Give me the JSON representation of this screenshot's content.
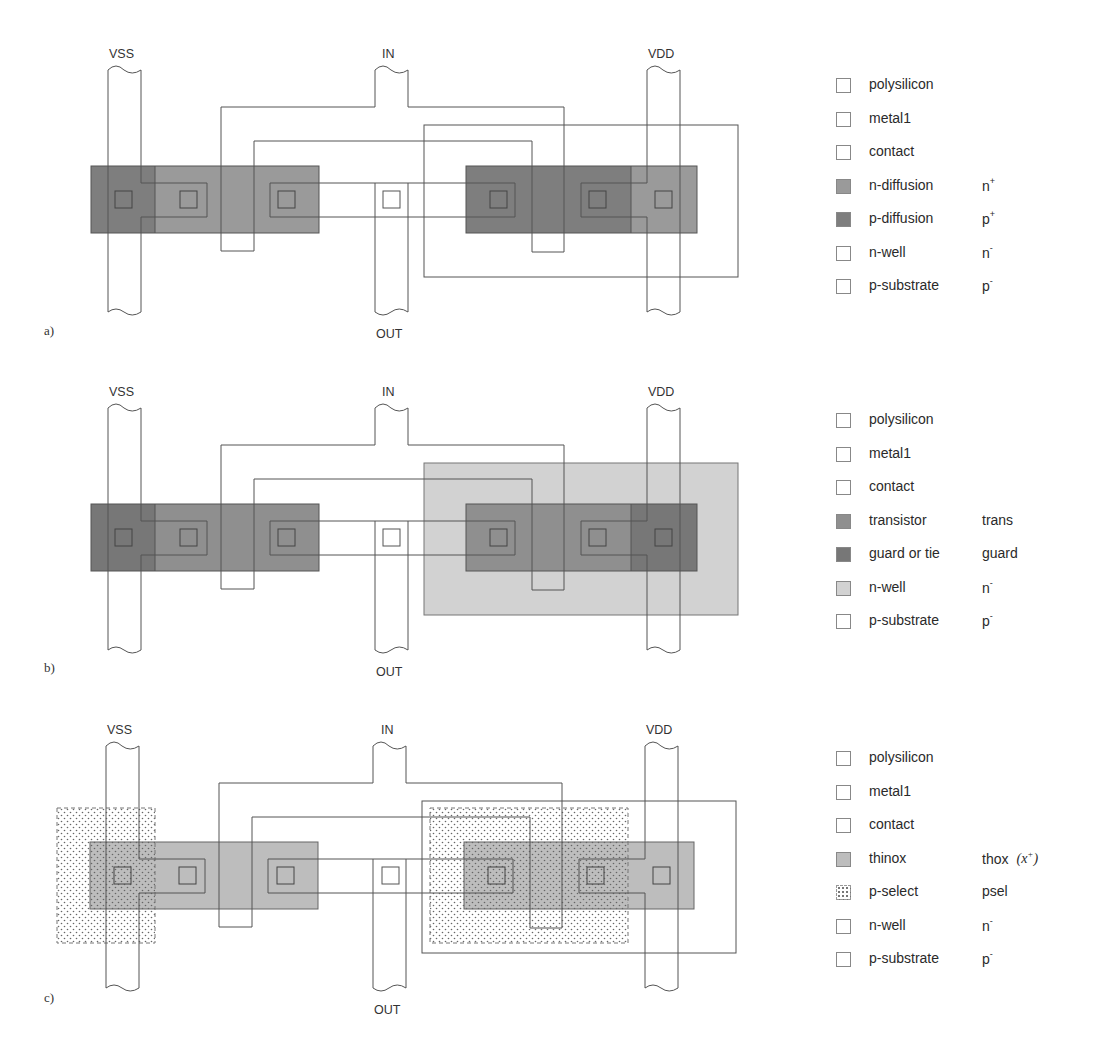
{
  "figure": {
    "panels": [
      {
        "id": "a",
        "label": "a)",
        "signals": {
          "vss": "VSS",
          "in": "IN",
          "out": "OUT",
          "vdd": "VDD"
        },
        "legend": [
          {
            "name": "polysilicon",
            "abbr": "",
            "sup": "",
            "swatch": "#ffffff",
            "pattern": "none"
          },
          {
            "name": "metal1",
            "abbr": "",
            "sup": "",
            "swatch": "#ffffff",
            "pattern": "none"
          },
          {
            "name": "contact",
            "abbr": "",
            "sup": "",
            "swatch": "#ffffff",
            "pattern": "none"
          },
          {
            "name": "n-diffusion",
            "abbr": "n",
            "sup": "+",
            "swatch": "#9a9a9a",
            "pattern": "none"
          },
          {
            "name": "p-diffusion",
            "abbr": "p",
            "sup": "+",
            "swatch": "#7e7e7e",
            "pattern": "none"
          },
          {
            "name": "n-well",
            "abbr": "n",
            "sup": "-",
            "swatch": "#ffffff",
            "pattern": "none"
          },
          {
            "name": "p-substrate",
            "abbr": "p",
            "sup": "-",
            "swatch": "#ffffff",
            "pattern": "none"
          }
        ]
      },
      {
        "id": "b",
        "label": "b)",
        "signals": {
          "vss": "VSS",
          "in": "IN",
          "out": "OUT",
          "vdd": "VDD"
        },
        "legend": [
          {
            "name": "polysilicon",
            "abbr": "",
            "sup": "",
            "swatch": "#ffffff",
            "pattern": "none"
          },
          {
            "name": "metal1",
            "abbr": "",
            "sup": "",
            "swatch": "#ffffff",
            "pattern": "none"
          },
          {
            "name": "contact",
            "abbr": "",
            "sup": "",
            "swatch": "#ffffff",
            "pattern": "none"
          },
          {
            "name": "transistor",
            "abbr": "trans",
            "sup": "",
            "swatch": "#8f8f8f",
            "pattern": "none"
          },
          {
            "name": "guard or tie",
            "abbr": "guard",
            "sup": "",
            "swatch": "#777777",
            "pattern": "none"
          },
          {
            "name": "n-well",
            "abbr": "n",
            "sup": "-",
            "swatch": "#d2d2d2",
            "pattern": "none"
          },
          {
            "name": "p-substrate",
            "abbr": "p",
            "sup": "-",
            "swatch": "#ffffff",
            "pattern": "none"
          }
        ]
      },
      {
        "id": "c",
        "label": "c)",
        "signals": {
          "vss": "VSS",
          "in": "IN",
          "out": "OUT",
          "vdd": "VDD"
        },
        "legend": [
          {
            "name": "polysilicon",
            "abbr": "",
            "sup": "",
            "swatch": "#ffffff",
            "pattern": "none"
          },
          {
            "name": "metal1",
            "abbr": "",
            "sup": "",
            "swatch": "#ffffff",
            "pattern": "none"
          },
          {
            "name": "contact",
            "abbr": "",
            "sup": "",
            "swatch": "#ffffff",
            "pattern": "none"
          },
          {
            "name": "thinox",
            "abbr": "thox",
            "sup": "",
            "math": "(x+)",
            "swatch": "#bdbdbd",
            "pattern": "none"
          },
          {
            "name": "p-select",
            "abbr": "psel",
            "sup": "",
            "swatch": "#ffffff",
            "pattern": "dots"
          },
          {
            "name": "n-well",
            "abbr": "n",
            "sup": "-",
            "swatch": "#ffffff",
            "pattern": "none"
          },
          {
            "name": "p-substrate",
            "abbr": "p",
            "sup": "-",
            "swatch": "#ffffff",
            "pattern": "none"
          }
        ]
      }
    ],
    "colors": {
      "line": "#555555",
      "n_diffusion": "#9a9a9a",
      "p_diffusion": "#7e7e7e",
      "transistor": "#8f8f8f",
      "guard": "#777777",
      "n_well_fill": "#d2d2d2",
      "thinox": "#bdbdbd"
    }
  }
}
